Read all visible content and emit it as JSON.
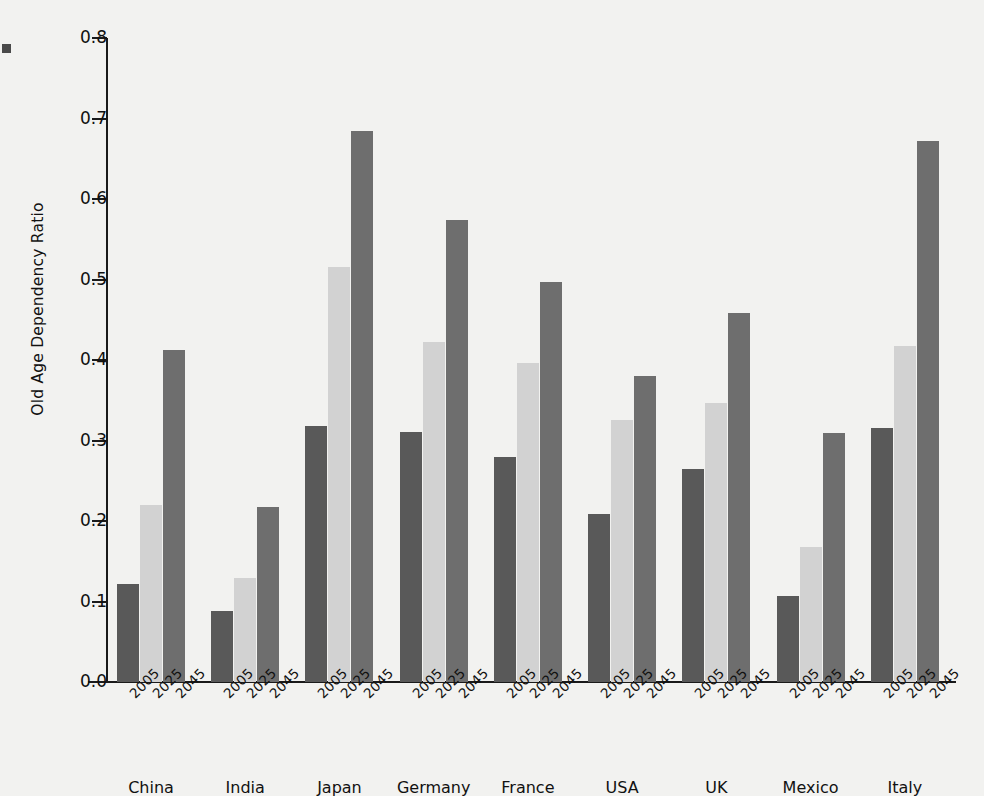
{
  "chart_data": {
    "type": "bar",
    "title": "",
    "subtitle": "",
    "xlabel": "",
    "ylabel": "Old Age Dependency Ratio",
    "ylim": [
      0.0,
      0.8
    ],
    "ytick_labels": [
      "0.0",
      "0.1",
      "0.2",
      "0.3",
      "0.4",
      "0.5",
      "0.6",
      "0.7",
      "0.8"
    ],
    "ytick_values": [
      0.0,
      0.1,
      0.2,
      0.3,
      0.4,
      0.5,
      0.6,
      0.7,
      0.8
    ],
    "grid": false,
    "legend": "none",
    "categories": [
      "China",
      "India",
      "Japan",
      "Germany",
      "France",
      "USA",
      "UK",
      "Mexico",
      "Italy"
    ],
    "group_tick_labels": [
      "2005",
      "2025",
      "2045"
    ],
    "series": [
      {
        "name": "2005",
        "color": "#595959",
        "values": [
          0.122,
          0.088,
          0.318,
          0.31,
          0.279,
          0.209,
          0.264,
          0.107,
          0.316
        ]
      },
      {
        "name": "2025",
        "color": "#d2d2d2",
        "values": [
          0.22,
          0.129,
          0.516,
          0.423,
          0.396,
          0.326,
          0.347,
          0.168,
          0.418
        ]
      },
      {
        "name": "2045",
        "color": "#6e6e6e",
        "values": [
          0.413,
          0.218,
          0.684,
          0.574,
          0.497,
          0.38,
          0.459,
          0.309,
          0.672
        ]
      }
    ]
  },
  "figure": {
    "background_color": "#f2f2f0",
    "axis_color": "#1a1a1a",
    "text_color": "#111111"
  }
}
